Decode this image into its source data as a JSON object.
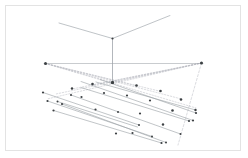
{
  "figure": {
    "background_color": "#ffffff",
    "border_color": "#e3e3e3",
    "line_color": "#9aa0a6",
    "construction_color": "#b9bcc2",
    "node_color": "#3c4043",
    "width": 248,
    "height": 158,
    "border": {
      "x": 5,
      "y": 5,
      "width": 236,
      "height": 146
    }
  },
  "labels": {
    "left_vanishing_point": "VPL",
    "right_vanishing_point": "VPR",
    "horizon": "horizon line",
    "mast": "vertical mast",
    "arm_left": "upper left arm",
    "arm_right": "upper right arm",
    "ground_grid": "ground plane grid"
  },
  "geometry": {
    "horizon_line": {
      "x1": 44,
      "y1": 63.5,
      "x2": 203,
      "y2": 63.5
    },
    "vanishing_points": [
      {
        "name": "left",
        "x": 45.5,
        "y": 63.5,
        "r": 1.5
      },
      {
        "name": "right",
        "x": 201.5,
        "y": 63.0,
        "r": 1.5
      }
    ],
    "mast": {
      "x1": 112.5,
      "y1": 38.5,
      "x2": 112.5,
      "y2": 82.5
    },
    "mast_nodes": [
      {
        "x": 112.5,
        "y": 38.5,
        "r": 1.1
      },
      {
        "x": 112.5,
        "y": 82.5,
        "r": 1.6
      }
    ],
    "upper_arms": [
      {
        "name": "arm_left",
        "x1": 112.5,
        "y1": 38.5,
        "x2": 59.0,
        "y2": 23.0
      },
      {
        "name": "arm_right",
        "x1": 112.5,
        "y1": 38.5,
        "x2": 170.0,
        "y2": 15.5
      }
    ],
    "construction_rays_left": [
      {
        "x1": 45.5,
        "y1": 63.5,
        "x2": 112.5,
        "y2": 82.5
      },
      {
        "x1": 45.5,
        "y1": 63.5,
        "x2": 137.0,
        "y2": 86.0
      },
      {
        "x1": 45.5,
        "y1": 63.5,
        "x2": 161.0,
        "y2": 91.5
      },
      {
        "x1": 45.5,
        "y1": 63.5,
        "x2": 181.5,
        "y2": 99.0
      },
      {
        "x1": 45.5,
        "y1": 63.5,
        "x2": 196.0,
        "y2": 108.0
      }
    ],
    "construction_rays_right": [
      {
        "x1": 201.5,
        "y1": 63.0,
        "x2": 112.5,
        "y2": 82.5
      },
      {
        "x1": 201.5,
        "y1": 63.0,
        "x2": 92.5,
        "y2": 85.0
      },
      {
        "x1": 201.5,
        "y1": 63.0,
        "x2": 72.0,
        "y2": 89.0
      },
      {
        "x1": 201.5,
        "y1": 63.0,
        "x2": 56.0,
        "y2": 94.0
      },
      {
        "x1": 201.5,
        "y1": 63.0,
        "x2": 47.0,
        "y2": 99.0
      }
    ],
    "grid_lines_left_family": [
      {
        "x1": 43.0,
        "y1": 92.5,
        "x2": 139.0,
        "y2": 125.0
      },
      {
        "x1": 47.5,
        "y1": 101.0,
        "x2": 152.0,
        "y2": 136.5
      },
      {
        "x1": 53.5,
        "y1": 110.5,
        "x2": 161.5,
        "y2": 143.0
      },
      {
        "x1": 81.0,
        "y1": 81.5,
        "x2": 193.0,
        "y2": 120.5
      },
      {
        "x1": 100.0,
        "y1": 79.5,
        "x2": 196.0,
        "y2": 113.0
      }
    ],
    "grid_lines_right_family": [
      {
        "x1": 195.5,
        "y1": 110.0,
        "x2": 96.0,
        "y2": 82.0
      },
      {
        "x1": 189.0,
        "y1": 121.0,
        "x2": 81.0,
        "y2": 87.5
      },
      {
        "x1": 180.5,
        "y1": 134.0,
        "x2": 71.0,
        "y2": 95.0
      },
      {
        "x1": 166.0,
        "y1": 142.5,
        "x2": 62.0,
        "y2": 104.0
      },
      {
        "x1": 137.5,
        "y1": 127.0,
        "x2": 57.5,
        "y2": 101.5
      }
    ],
    "grid_nodes": [
      {
        "x": 112.5,
        "y": 82.5,
        "r": 1.5
      },
      {
        "x": 92.5,
        "y": 84.0,
        "r": 1.3
      },
      {
        "x": 136.5,
        "y": 85.5,
        "r": 1.3
      },
      {
        "x": 72.0,
        "y": 88.5,
        "r": 1.2
      },
      {
        "x": 160.5,
        "y": 91.0,
        "r": 1.3
      },
      {
        "x": 104.0,
        "y": 93.0,
        "r": 1.1
      },
      {
        "x": 127.0,
        "y": 95.5,
        "r": 1.1
      },
      {
        "x": 81.5,
        "y": 97.0,
        "r": 1.1
      },
      {
        "x": 150.0,
        "y": 100.5,
        "r": 1.1
      },
      {
        "x": 181.0,
        "y": 99.5,
        "r": 1.3
      },
      {
        "x": 172.5,
        "y": 110.5,
        "r": 1.3
      },
      {
        "x": 95.5,
        "y": 109.5,
        "r": 1.1
      },
      {
        "x": 140.0,
        "y": 113.5,
        "r": 1.1
      },
      {
        "x": 118.0,
        "y": 112.0,
        "r": 1.0
      },
      {
        "x": 163.0,
        "y": 124.5,
        "r": 1.2
      }
    ],
    "endpoint_nodes": [
      {
        "x": 43.0,
        "y": 92.5,
        "r": 1.1
      },
      {
        "x": 47.5,
        "y": 101.0,
        "r": 1.1
      },
      {
        "x": 53.5,
        "y": 110.5,
        "r": 1.1
      },
      {
        "x": 62.0,
        "y": 104.0,
        "r": 1.1
      },
      {
        "x": 57.5,
        "y": 101.5,
        "r": 1.0
      },
      {
        "x": 71.0,
        "y": 95.0,
        "r": 1.0
      },
      {
        "x": 116.0,
        "y": 133.5,
        "r": 1.1
      },
      {
        "x": 132.5,
        "y": 133.0,
        "r": 1.1
      },
      {
        "x": 139.0,
        "y": 125.0,
        "r": 1.0
      },
      {
        "x": 152.0,
        "y": 136.5,
        "r": 1.0
      },
      {
        "x": 161.5,
        "y": 143.0,
        "r": 1.1
      },
      {
        "x": 166.0,
        "y": 142.5,
        "r": 1.0
      },
      {
        "x": 180.5,
        "y": 134.0,
        "r": 1.0
      },
      {
        "x": 189.0,
        "y": 121.0,
        "r": 1.1
      },
      {
        "x": 193.0,
        "y": 120.5,
        "r": 1.1
      },
      {
        "x": 196.0,
        "y": 113.0,
        "r": 1.1
      },
      {
        "x": 195.5,
        "y": 110.0,
        "r": 1.2
      }
    ],
    "drop_line_right": {
      "x1": 201.5,
      "y1": 63.0,
      "x2": 178.0,
      "y2": 145.0
    }
  }
}
